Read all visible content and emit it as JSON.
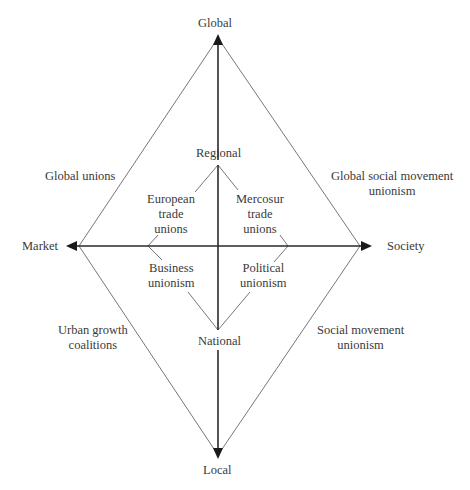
{
  "axes": {
    "top": "Global",
    "bottom": "Local",
    "left": "Market",
    "right": "Society"
  },
  "inner": {
    "top": "Regional",
    "bottom": "National"
  },
  "quadrants": {
    "outer_top_left": "Global unions",
    "outer_top_right_1": "Global social movement",
    "outer_top_right_2": "unionism",
    "outer_bottom_left_1": "Urban growth",
    "outer_bottom_left_2": "coalitions",
    "outer_bottom_right_1": "Social movement",
    "outer_bottom_right_2": "unionism",
    "inner_top_left_1": "European",
    "inner_top_left_2": "trade",
    "inner_top_left_3": "unions",
    "inner_top_right_1": "Mercosur",
    "inner_top_right_2": "trade",
    "inner_top_right_3": "unions",
    "inner_bottom_left_1": "Business",
    "inner_bottom_left_2": "unionism",
    "inner_bottom_right_1": "Political",
    "inner_bottom_right_2": "unionism"
  },
  "colors": {
    "axis": "#2a2a2a",
    "diamond": "#6a6a6a",
    "text": "#3a3a3a"
  }
}
